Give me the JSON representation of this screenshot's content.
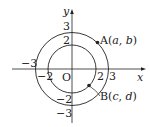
{
  "diagram": {
    "axes": {
      "x_label": "x",
      "y_label": "y",
      "origin_label": "O"
    },
    "ticks": {
      "x_pos": [
        "2",
        "3"
      ],
      "x_neg": [
        "−2",
        "−3"
      ],
      "y_pos": [
        "2",
        "3"
      ],
      "y_neg": [
        "−2",
        "−3"
      ]
    },
    "circles": [
      {
        "name": "inner",
        "radius": 2
      },
      {
        "name": "outer",
        "radius": 3
      }
    ],
    "points": {
      "A": {
        "label": "A(",
        "var1": "a",
        "sep": ", ",
        "var2": "b",
        "close": ")"
      },
      "B": {
        "label": "B(",
        "var1": "c",
        "sep": ", ",
        "var2": "d",
        "close": ")"
      }
    },
    "colors": {
      "stroke": "#222222",
      "background": "#ffffff"
    }
  }
}
